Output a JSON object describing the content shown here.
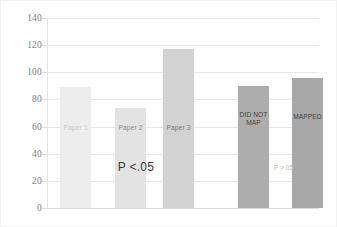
{
  "chart_data": {
    "type": "bar",
    "title": "",
    "subtitle": "",
    "xlabel": "",
    "ylabel": "",
    "ylim": [
      0,
      140
    ],
    "ytick_step": 20,
    "yticks": [
      "140",
      "120",
      "100",
      "80",
      "60",
      "40",
      "20",
      "0"
    ],
    "grid": true,
    "legend": false,
    "legend_position": "none",
    "categories": [
      "Paper 1",
      "Paper 2",
      "Paper 3",
      "DID NOT MAP",
      "MAPPED"
    ],
    "values": [
      89,
      74,
      117,
      90,
      96
    ],
    "bars": [
      {
        "label": "Paper 1",
        "value": 89,
        "color": "#ededed",
        "label_color": "#c9c9c9",
        "group": "papers"
      },
      {
        "label": "Paper 2",
        "value": 74,
        "color": "#e3e3e3",
        "label_color": "#8c8c8c",
        "group": "papers"
      },
      {
        "label": "Paper 3",
        "value": 117,
        "color": "#d2d2d2",
        "label_color": "#7a7a7a",
        "group": "papers"
      },
      {
        "label": "DID NOT\nMAP",
        "value": 90,
        "color": "#adadad",
        "label_color": "#3f3f3f",
        "group": "mapping"
      },
      {
        "label": "MAPPED",
        "value": 96,
        "color": "#a8a8a8",
        "label_color": "#3f3f3f",
        "group": "mapping"
      }
    ],
    "annotations": [
      {
        "text": "P <.05",
        "x_value": 1.1,
        "y_value": 30
      },
      {
        "text": "P >.05",
        "x_value": 3.55,
        "y_value": 30
      }
    ]
  },
  "colors": {
    "background": "#ffffff",
    "gridline": "#e8e8e8",
    "axis": "#e4e4e4",
    "tick_text": "#7d7d7d"
  }
}
